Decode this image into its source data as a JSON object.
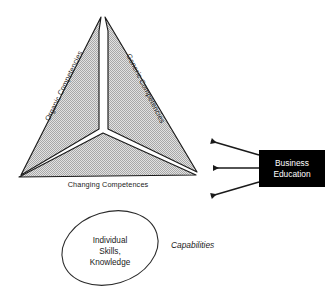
{
  "diagram": {
    "colors": {
      "segment_fill": "#c9c9c9",
      "segment_stroke": "#1a1a1a",
      "box_fill": "#000000",
      "box_text": "#ffffff",
      "arrow": "#1a1a1a",
      "ellipse_stroke": "#2b2b2b",
      "background": "#ffffff"
    },
    "triangle": {
      "name": "competencies-triangle",
      "segments": [
        {
          "id": "left",
          "label": "Organic Competencies"
        },
        {
          "id": "right",
          "label": "Generic Competencies"
        },
        {
          "id": "bottom",
          "label": "Changing Competences"
        }
      ]
    },
    "ellipse": {
      "name": "individual-skills-ellipse",
      "lines": [
        "Individual",
        "Skills,",
        "Knowledge"
      ]
    },
    "capabilities_label": "Capabilities",
    "box": {
      "name": "business-education-box",
      "lines": [
        "Business",
        "Education"
      ]
    },
    "arrows": [
      {
        "id": "arrow-upper",
        "direction": "left-up"
      },
      {
        "id": "arrow-middle",
        "direction": "left"
      },
      {
        "id": "arrow-lower",
        "direction": "left-down"
      }
    ]
  }
}
